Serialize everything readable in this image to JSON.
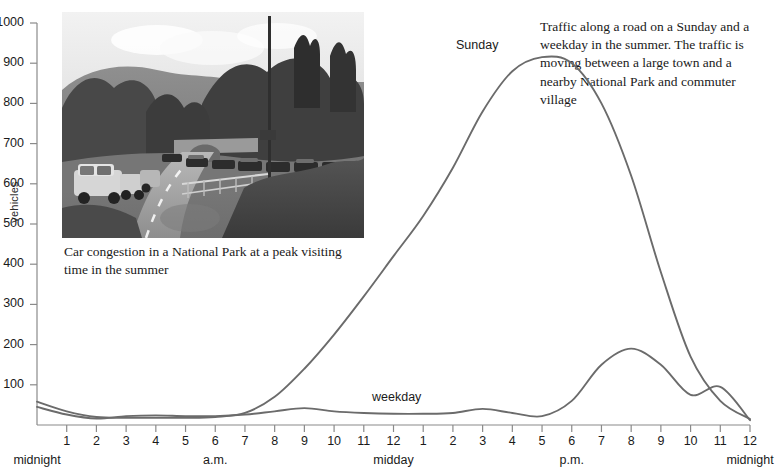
{
  "axes": {
    "y_label": "vehicles",
    "y_ticks": [
      0,
      100,
      200,
      300,
      400,
      500,
      600,
      700,
      800,
      900,
      1000
    ],
    "y_tick_labels": [
      "",
      "100",
      "200",
      "300",
      "400",
      "500",
      "600",
      "700",
      "800",
      "900",
      "1000"
    ],
    "x_tick_labels": [
      "1",
      "2",
      "3",
      "4",
      "5",
      "6",
      "7",
      "8",
      "9",
      "10",
      "11",
      "12",
      "1",
      "2",
      "3",
      "4",
      "5",
      "6",
      "7",
      "8",
      "9",
      "10",
      "11",
      "12"
    ],
    "x_period_labels": [
      {
        "text": "midnight",
        "hour": 0
      },
      {
        "text": "a.m.",
        "hour": 6
      },
      {
        "text": "midday",
        "hour": 12
      },
      {
        "text": "p.m.",
        "hour": 18
      },
      {
        "text": "midnight",
        "hour": 24
      }
    ]
  },
  "series_labels": {
    "sunday": "Sunday",
    "weekday": "weekday"
  },
  "photo": {
    "caption": "Car congestion in a National Park at a peak visiting time in the summer",
    "alt": "black-and-white photograph of congested rural road"
  },
  "note": {
    "text": "Traffic along a road on a Sunday and a weekday in the summer. The traffic is moving between a large town and a nearby National Park and commuter village"
  },
  "colors": {
    "curve": "#6b6b6b",
    "axis": "#8a8a8a",
    "text": "#1a1a1a"
  },
  "chart_data": {
    "type": "line",
    "title": "",
    "xlabel": "",
    "ylabel": "vehicles",
    "ylim": [
      0,
      1000
    ],
    "xlim": [
      0,
      24
    ],
    "grid": false,
    "legend": "inline-labels",
    "x": [
      0,
      1,
      2,
      3,
      4,
      5,
      6,
      7,
      8,
      9,
      10,
      11,
      12,
      13,
      14,
      15,
      16,
      17,
      18,
      19,
      20,
      21,
      22,
      23,
      24
    ],
    "series": [
      {
        "name": "Sunday",
        "values": [
          58,
          34,
          20,
          18,
          18,
          18,
          20,
          30,
          70,
          140,
          225,
          320,
          420,
          520,
          640,
          780,
          880,
          915,
          900,
          800,
          620,
          380,
          170,
          60,
          15
        ]
      },
      {
        "name": "weekday",
        "values": [
          45,
          26,
          16,
          22,
          24,
          22,
          22,
          26,
          34,
          42,
          34,
          30,
          28,
          28,
          30,
          40,
          30,
          22,
          60,
          150,
          190,
          150,
          75,
          95,
          12
        ]
      }
    ]
  }
}
